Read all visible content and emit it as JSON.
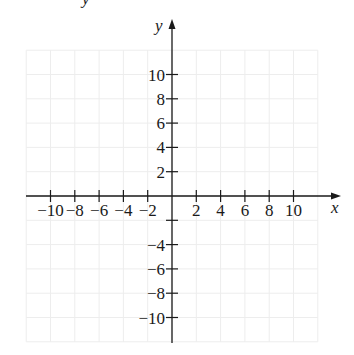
{
  "chart_data": {
    "type": "coordinate-plane",
    "title": "",
    "xlabel": "x",
    "ylabel": "y",
    "xlim": [
      -12,
      12
    ],
    "ylim": [
      -12,
      12
    ],
    "grid": true,
    "grid_step": 2,
    "x_ticks": [
      -10,
      -8,
      -6,
      -4,
      -2,
      2,
      4,
      6,
      8,
      10
    ],
    "x_tick_labels": [
      "−10",
      "−8",
      "−6",
      "−4",
      "−2",
      "2",
      "4",
      "6",
      "8",
      "10"
    ],
    "y_ticks": [
      10,
      8,
      6,
      4,
      2,
      -4,
      -6,
      -8,
      -10
    ],
    "y_tick_labels": [
      "10",
      "8",
      "6",
      "4",
      "2",
      "−4",
      "−6",
      "−8",
      "−10"
    ],
    "series": []
  },
  "top_fragment": "y"
}
